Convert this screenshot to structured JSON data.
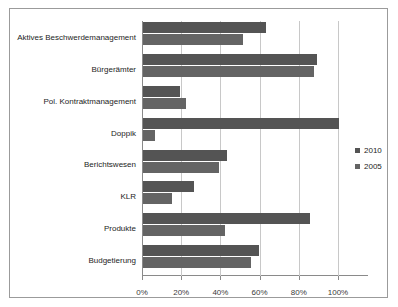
{
  "chart_data": {
    "type": "bar",
    "orientation": "horizontal",
    "title": "",
    "xlabel": "",
    "ylabel": "",
    "xlim": [
      0,
      100
    ],
    "xticks": [
      "0%",
      "20%",
      "40%",
      "60%",
      "80%",
      "100%"
    ],
    "xtick_values": [
      0,
      20,
      40,
      60,
      80,
      100
    ],
    "grid": true,
    "legend_position": "right",
    "categories": [
      "Aktives Beschwerdemanagement",
      "Bürgerämter",
      "Pol. Kontraktmanagement",
      "Doppik",
      "Berichtswesen",
      "KLR",
      "Produkte",
      "Budgetierung"
    ],
    "series": [
      {
        "name": "2010",
        "color": "#545454",
        "values": [
          63,
          89,
          19,
          100,
          43,
          26,
          85,
          59
        ]
      },
      {
        "name": "2005",
        "color": "#646464",
        "values": [
          51,
          87,
          22,
          6,
          39,
          15,
          42,
          55
        ]
      }
    ]
  },
  "legend": {
    "items": [
      {
        "label": "2010",
        "color": "#545454"
      },
      {
        "label": "2005",
        "color": "#646464"
      }
    ]
  }
}
